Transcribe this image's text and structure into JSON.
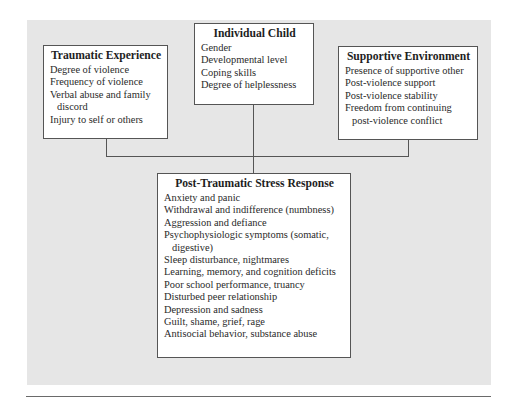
{
  "diagram": {
    "boxes": {
      "traumatic_experience": {
        "title": "Traumatic Experience",
        "items": [
          "Degree of violence",
          "Frequency of violence",
          "Verbal abuse and family discord",
          "Injury to self or others"
        ]
      },
      "individual_child": {
        "title": "Individual Child",
        "items": [
          "Gender",
          "Developmental level",
          "Coping skills",
          "Degree of helplessness"
        ]
      },
      "supportive_environment": {
        "title": "Supportive Environment",
        "items": [
          "Presence of supportive other",
          "Post-violence support",
          "Post-violence stability",
          "Freedom from continuing post-violence conflict"
        ]
      },
      "post_traumatic_stress_response": {
        "title": "Post-Traumatic Stress Response",
        "items": [
          "Anxiety and panic",
          "Withdrawal and indifference (numbness)",
          "Aggression and defiance",
          "Psychophysiologic symptoms (somatic, digestive)",
          "Sleep disturbance, nightmares",
          "Learning, memory, and cognition deficits",
          "Poor school performance, truancy",
          "Disturbed peer relationship",
          "Depression and sadness",
          "Guilt, shame, grief, rage",
          "Antisocial behavior, substance abuse"
        ]
      }
    },
    "connections": [
      {
        "from": "Traumatic Experience",
        "to": "Post-Traumatic Stress Response"
      },
      {
        "from": "Individual Child",
        "to": "Post-Traumatic Stress Response"
      },
      {
        "from": "Supportive Environment",
        "to": "Post-Traumatic Stress Response"
      }
    ],
    "colors": {
      "panel_background": "#e6e6e6",
      "box_background": "#ffffff",
      "border": "#555555",
      "text": "#2a2a2a"
    }
  }
}
